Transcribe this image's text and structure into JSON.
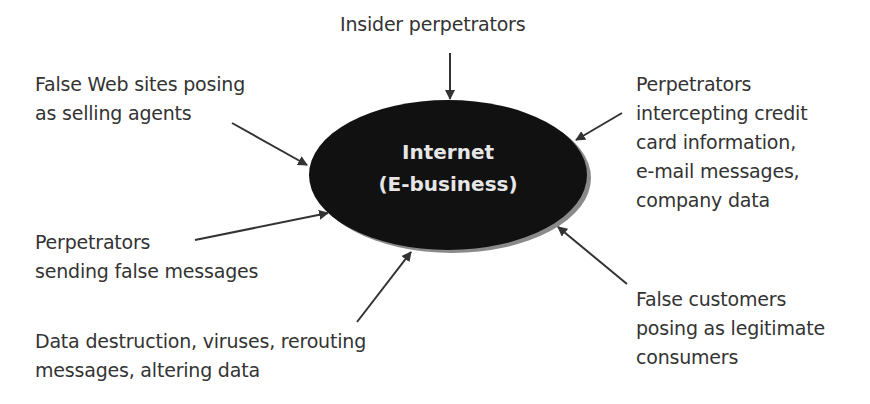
{
  "diagram": {
    "center": {
      "lines": [
        "Internet",
        "(E-business)"
      ],
      "fill_color": "#111111",
      "shadow_color": "#888888",
      "text_color": "#e6e6e6"
    },
    "nodes": [
      {
        "id": "insider",
        "lines": [
          "Insider perpetrators"
        ]
      },
      {
        "id": "false-web-sites",
        "lines": [
          "False Web sites posing",
          "as selling agents"
        ]
      },
      {
        "id": "intercepting",
        "lines": [
          "Perpetrators",
          "intercepting credit",
          "card information,",
          "e-mail messages,",
          "company data"
        ]
      },
      {
        "id": "false-messages",
        "lines": [
          "Perpetrators",
          "sending false messages"
        ]
      },
      {
        "id": "data-destruction",
        "lines": [
          "Data destruction, viruses, rerouting",
          "messages, altering data"
        ]
      },
      {
        "id": "false-customers",
        "lines": [
          "False customers",
          "posing as legitimate",
          "consumers"
        ]
      }
    ],
    "arrow_color": "#333333"
  }
}
